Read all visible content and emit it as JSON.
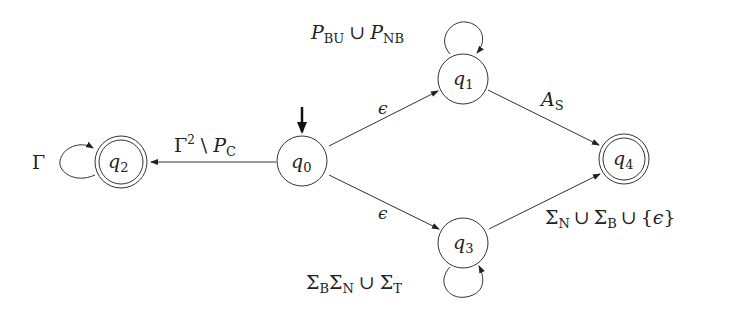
{
  "diagram": {
    "type": "finite-automaton",
    "states": [
      {
        "id": "q0",
        "name": "q",
        "sub": "0",
        "initial": true,
        "accepting": false
      },
      {
        "id": "q1",
        "name": "q",
        "sub": "1",
        "initial": false,
        "accepting": false
      },
      {
        "id": "q2",
        "name": "q",
        "sub": "2",
        "initial": false,
        "accepting": true
      },
      {
        "id": "q3",
        "name": "q",
        "sub": "3",
        "initial": false,
        "accepting": false
      },
      {
        "id": "q4",
        "name": "q",
        "sub": "4",
        "initial": false,
        "accepting": true
      }
    ],
    "transitions": [
      {
        "from": "q0",
        "to": "q2",
        "label": "Γ² \\ P_C"
      },
      {
        "from": "q0",
        "to": "q1",
        "label": "ϵ"
      },
      {
        "from": "q0",
        "to": "q3",
        "label": "ϵ"
      },
      {
        "from": "q1",
        "to": "q1",
        "label": "P_BU ∪ P_NB"
      },
      {
        "from": "q1",
        "to": "q4",
        "label": "A_S"
      },
      {
        "from": "q3",
        "to": "q3",
        "label": "Σ_B Σ_N ∪ Σ_T"
      },
      {
        "from": "q3",
        "to": "q4",
        "label": "Σ_N ∪ Σ_B ∪ {ϵ}"
      },
      {
        "from": "q2",
        "to": "q2",
        "label": "Γ"
      }
    ],
    "labels": {
      "q": "q",
      "s0": "0",
      "s1": "1",
      "s2": "2",
      "s3": "3",
      "s4": "4",
      "gamma": "Γ",
      "sup2": "2",
      "setminus": "\\",
      "P": "P",
      "C": "C",
      "eps": "ϵ",
      "BU": "BU",
      "cup": "∪",
      "NB": "NB",
      "A": "A",
      "S": "S",
      "Sigma": "Σ",
      "B": "B",
      "N": "N",
      "T": "T",
      "lbrace": "{",
      "rbrace": "}"
    }
  }
}
